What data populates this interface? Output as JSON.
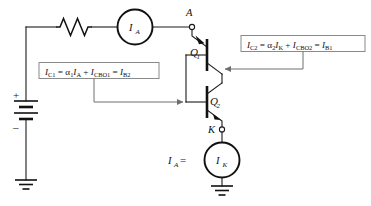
{
  "figure": {
    "type": "circuit-diagram",
    "background_color": "#ffffff",
    "line_color": "#111111",
    "leader_color": "#6e6e6e",
    "box_border_color": "#8a8a8a"
  },
  "terminals": {
    "anode": "A",
    "cathode": "K"
  },
  "devices": {
    "q1": {
      "label": "Q",
      "subscript": "1",
      "type": "pnp-transistor"
    },
    "q2": {
      "label": "Q",
      "subscript": "2",
      "type": "npn-transistor"
    },
    "resistor": {
      "label": "",
      "type": "resistor-zigzag"
    },
    "battery": {
      "plus": "+",
      "minus": "–",
      "type": "battery-multicell"
    }
  },
  "sources": {
    "top": {
      "label": "I",
      "subscript": "A",
      "name": "anode-current-source"
    },
    "bottom": {
      "label": "I",
      "subscript": "K",
      "name": "cathode-current-source",
      "prefix_label": "I",
      "prefix_sub": "A",
      "prefix_equals": "="
    }
  },
  "equations": {
    "left": {
      "full_text": "I_C1 = α₁I_A + I_CBO1 = I_B2",
      "parts": [
        {
          "t": "I",
          "style": "italic"
        },
        {
          "t": "C1",
          "style": "sub-roman"
        },
        {
          "t": " = ",
          "style": "roman"
        },
        {
          "t": "α",
          "style": "roman"
        },
        {
          "t": "1",
          "style": "sub-roman"
        },
        {
          "t": "I",
          "style": "italic"
        },
        {
          "t": "A",
          "style": "sub-italic"
        },
        {
          "t": " + ",
          "style": "roman"
        },
        {
          "t": "I",
          "style": "italic"
        },
        {
          "t": "CBO1",
          "style": "sub-roman"
        },
        {
          "t": " = ",
          "style": "roman"
        },
        {
          "t": "I",
          "style": "italic"
        },
        {
          "t": "B2",
          "style": "sub-roman"
        }
      ],
      "points_to": "q2-base"
    },
    "right": {
      "full_text": "I_C2 = α₂I_K + I_CBO2 = I_B1",
      "parts": [
        {
          "t": "I",
          "style": "italic"
        },
        {
          "t": "C2",
          "style": "sub-roman"
        },
        {
          "t": " = ",
          "style": "roman"
        },
        {
          "t": "α",
          "style": "roman"
        },
        {
          "t": "2",
          "style": "sub-roman"
        },
        {
          "t": "I",
          "style": "italic"
        },
        {
          "t": "K",
          "style": "sub-italic"
        },
        {
          "t": " + ",
          "style": "roman"
        },
        {
          "t": "I",
          "style": "italic"
        },
        {
          "t": "CBO2",
          "style": "sub-roman"
        },
        {
          "t": " = ",
          "style": "roman"
        },
        {
          "t": "I",
          "style": "italic"
        },
        {
          "t": "B1",
          "style": "sub-roman"
        }
      ],
      "points_to": "q1-base"
    }
  },
  "grounds": {
    "left": "ground-symbol",
    "bottom": "ground-symbol"
  }
}
